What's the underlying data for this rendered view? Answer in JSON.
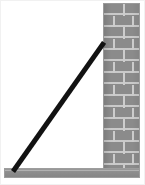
{
  "diagram": {
    "canvas": {
      "width": 145,
      "height": 185,
      "background": "#ffffff"
    },
    "objects": {
      "wall": {
        "name": "brick-wall",
        "fill": "#8b8b8b",
        "mortar_color": "#cdcdcd",
        "border_color": "#9a9a9a",
        "x": 103,
        "y": 3,
        "width": 37,
        "height": 167,
        "course_height": 11.5,
        "courses": 15
      },
      "floor": {
        "name": "floor-slab",
        "fill": "#8e8e8e",
        "border_color": "#9d9d9d",
        "x": 4,
        "y": 168,
        "width": 136,
        "height": 10
      },
      "ladder": {
        "name": "leaning-ladder",
        "fill": "#121212",
        "thickness": 5,
        "foot_x": 13,
        "foot_y": 171,
        "top_x": 104,
        "top_y": 42,
        "angle_degrees": 58.2,
        "length": 152
      }
    },
    "frame": {
      "border_color": "#f1f1f1"
    }
  }
}
